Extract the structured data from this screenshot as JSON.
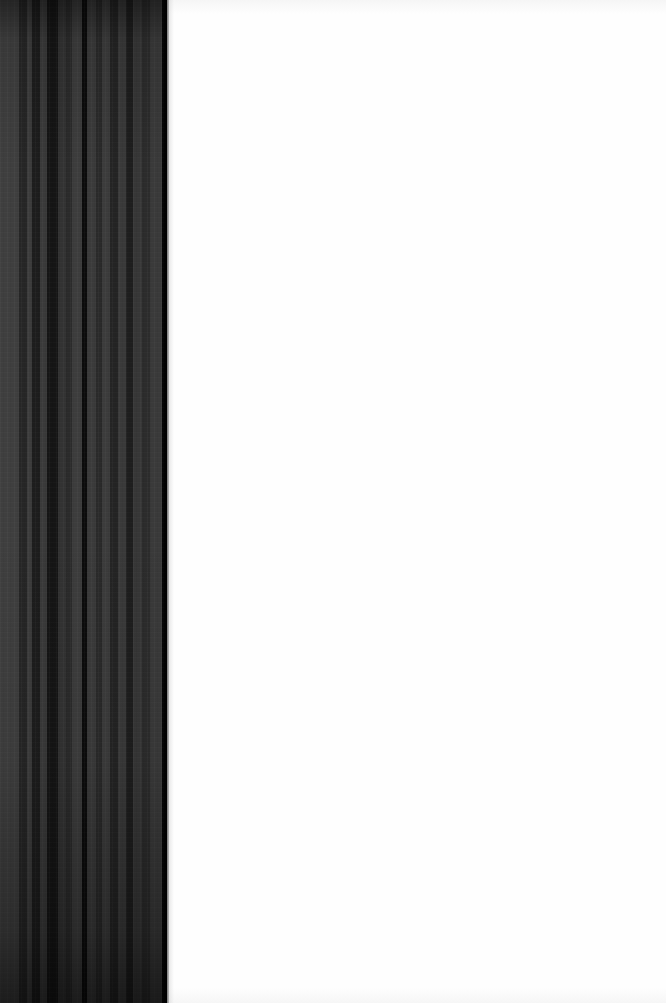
{
  "page": {
    "width_px": 666,
    "height_px": 1003,
    "background_color": "#ffffff"
  },
  "content_region": {
    "name": "blank-page-area",
    "text": "",
    "x_px": 167,
    "width_px": 499,
    "height_px": 1003,
    "fill_color": "#fefefe",
    "has_visible_text": false
  },
  "stripe_panel": {
    "name": "dark-striped-margin",
    "x_px": 0,
    "width_px": 167,
    "height_px": 1003,
    "base_color": "#3a3a3a",
    "darkest_color": "#060606",
    "lightest_color": "#3f3f3f",
    "orientation": "vertical",
    "edge_color": "#000000",
    "bands": [
      {
        "start_px": 0,
        "end_px": 19,
        "color": "#3f3f3f",
        "tone": "light"
      },
      {
        "start_px": 19,
        "end_px": 27,
        "color": "#262626",
        "tone": "dark"
      },
      {
        "start_px": 27,
        "end_px": 32,
        "color": "#3c3c3c",
        "tone": "light"
      },
      {
        "start_px": 32,
        "end_px": 40,
        "color": "#1d1d1d",
        "tone": "dark"
      },
      {
        "start_px": 40,
        "end_px": 47,
        "color": "#3a3a3a",
        "tone": "light"
      },
      {
        "start_px": 47,
        "end_px": 58,
        "color": "#151515",
        "tone": "very-dark"
      },
      {
        "start_px": 58,
        "end_px": 66,
        "color": "#333333",
        "tone": "medium"
      },
      {
        "start_px": 66,
        "end_px": 72,
        "color": "#2b2b2b",
        "tone": "dark"
      },
      {
        "start_px": 72,
        "end_px": 82,
        "color": "#3d3d3d",
        "tone": "light"
      },
      {
        "start_px": 82,
        "end_px": 87,
        "color": "#0b0b0b",
        "tone": "black"
      },
      {
        "start_px": 87,
        "end_px": 96,
        "color": "#3b3b3b",
        "tone": "light"
      },
      {
        "start_px": 96,
        "end_px": 102,
        "color": "#2a2a2a",
        "tone": "dark"
      },
      {
        "start_px": 102,
        "end_px": 110,
        "color": "#3c3c3c",
        "tone": "light"
      },
      {
        "start_px": 110,
        "end_px": 118,
        "color": "#242424",
        "tone": "dark"
      },
      {
        "start_px": 118,
        "end_px": 126,
        "color": "#3a3a3a",
        "tone": "light"
      },
      {
        "start_px": 126,
        "end_px": 133,
        "color": "#1e1e1e",
        "tone": "dark"
      },
      {
        "start_px": 133,
        "end_px": 142,
        "color": "#373737",
        "tone": "medium"
      },
      {
        "start_px": 142,
        "end_px": 150,
        "color": "#2c2c2c",
        "tone": "dark"
      },
      {
        "start_px": 150,
        "end_px": 162,
        "color": "#3a3a3a",
        "tone": "light"
      },
      {
        "start_px": 162,
        "end_px": 167,
        "color": "#060606",
        "tone": "black"
      }
    ],
    "vertical_shading": {
      "top_darkening": "strong",
      "middle": "none",
      "bottom_darkening": "strong"
    }
  }
}
